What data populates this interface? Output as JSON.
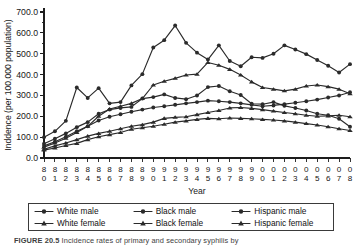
{
  "figure": {
    "caption_label": "FIGURE 20.5",
    "caption_text": " Incidence rates of primary and secondary syphilis by"
  },
  "legend": {
    "entries": [
      {
        "label": "White male",
        "marker": "circle"
      },
      {
        "label": "Black male",
        "marker": "circle"
      },
      {
        "label": "Hispanic male",
        "marker": "circle"
      },
      {
        "label": "White female",
        "marker": "triangle"
      },
      {
        "label": "Black female",
        "marker": "triangle"
      },
      {
        "label": "Hispanic female",
        "marker": "triangle"
      }
    ]
  },
  "chart_data": {
    "type": "line",
    "title": "",
    "xlabel": "Year",
    "ylabel": "Inddence (per 100,000 population)",
    "xlim": [
      1980,
      2008
    ],
    "ylim": [
      0,
      700
    ],
    "ytick_step": 100,
    "yminor_step": 50,
    "grid": false,
    "legend_position": "bottom",
    "ytick_labels": [
      "0.0",
      "100.0",
      "200.0",
      "300.0",
      "400.0",
      "500.0",
      "600.0",
      "700.0"
    ],
    "ytick_values": [
      0,
      100,
      200,
      300,
      400,
      500,
      600,
      700
    ],
    "x": [
      1980,
      1981,
      1982,
      1983,
      1984,
      1985,
      1986,
      1987,
      1988,
      1989,
      1990,
      1991,
      1992,
      1993,
      1994,
      1995,
      1996,
      1997,
      1998,
      1999,
      2000,
      2001,
      2002,
      2003,
      2004,
      2005,
      2006,
      2007,
      2008
    ],
    "xtick_labels_top": [
      "8",
      "8",
      "8",
      "8",
      "8",
      "8",
      "8",
      "8",
      "8",
      "8",
      "9",
      "9",
      "9",
      "9",
      "9",
      "9",
      "9",
      "9",
      "9",
      "9",
      "0",
      "0",
      "0",
      "0",
      "0",
      "0",
      "0",
      "0",
      "0"
    ],
    "xtick_labels_bottom": [
      "0",
      "1",
      "2",
      "3",
      "4",
      "5",
      "6",
      "7",
      "8",
      "9",
      "0",
      "1",
      "2",
      "3",
      "4",
      "5",
      "6",
      "7",
      "8",
      "9",
      "0",
      "1",
      "2",
      "3",
      "4",
      "5",
      "6",
      "7",
      "8"
    ],
    "series": [
      {
        "name": "Black male",
        "marker": "circle",
        "values": [
          100,
          128,
          178,
          338,
          288,
          335,
          262,
          268,
          348,
          402,
          530,
          565,
          635,
          552,
          505,
          472,
          540,
          465,
          440,
          483,
          480,
          500,
          540,
          520,
          498,
          470,
          442,
          410,
          450
        ]
      },
      {
        "name": "Hispanic male",
        "marker": "circle",
        "values": [
          68,
          92,
          118,
          148,
          172,
          212,
          232,
          240,
          245,
          285,
          292,
          305,
          288,
          282,
          300,
          340,
          345,
          320,
          302,
          260,
          258,
          268,
          250,
          240,
          228,
          212,
          205,
          188,
          150
        ]
      },
      {
        "name": "White male",
        "marker": "circle",
        "values": [
          58,
          78,
          102,
          128,
          152,
          180,
          198,
          210,
          222,
          232,
          242,
          248,
          255,
          262,
          268,
          275,
          272,
          268,
          262,
          255,
          248,
          252,
          258,
          265,
          272,
          280,
          290,
          300,
          315
        ]
      },
      {
        "name": "Black female",
        "marker": "triangle",
        "values": [
          52,
          72,
          95,
          122,
          152,
          200,
          235,
          248,
          262,
          285,
          350,
          368,
          382,
          398,
          402,
          458,
          445,
          425,
          398,
          365,
          338,
          330,
          322,
          330,
          345,
          350,
          342,
          330,
          308
        ]
      },
      {
        "name": "White female",
        "marker": "triangle",
        "values": [
          42,
          58,
          72,
          88,
          105,
          118,
          128,
          140,
          152,
          160,
          172,
          190,
          195,
          198,
          208,
          218,
          228,
          240,
          242,
          238,
          232,
          225,
          218,
          212,
          205,
          200,
          202,
          205,
          198
        ]
      },
      {
        "name": "Hispanic female",
        "marker": "triangle",
        "values": [
          38,
          48,
          60,
          70,
          88,
          102,
          112,
          122,
          138,
          145,
          152,
          162,
          172,
          178,
          185,
          190,
          188,
          192,
          190,
          188,
          185,
          182,
          178,
          172,
          165,
          158,
          150,
          140,
          132
        ]
      }
    ]
  }
}
